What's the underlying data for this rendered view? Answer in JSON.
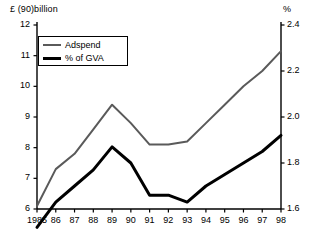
{
  "chart_data": {
    "type": "line",
    "title": "",
    "xlabel": "",
    "ylabel": "£ (90)billion",
    "y2label": "%",
    "grid": false,
    "legend_position": "top-left",
    "categories": [
      "1985",
      "86",
      "87",
      "88",
      "89",
      "90",
      "91",
      "92",
      "93",
      "94",
      "95",
      "96",
      "97",
      "98"
    ],
    "x": [
      1985,
      1986,
      1987,
      1988,
      1989,
      1990,
      1991,
      1992,
      1993,
      1994,
      1995,
      1996,
      1997,
      1998
    ],
    "ylim": [
      6,
      12
    ],
    "yticks": [
      6,
      7,
      8,
      9,
      10,
      11,
      12
    ],
    "ytick_labels": [
      "6",
      "7",
      "8",
      "9",
      "10",
      "11",
      "12"
    ],
    "y2lim": [
      1.6,
      2.4
    ],
    "y2ticks": [
      1.6,
      1.8,
      2.0,
      2.2,
      2.4
    ],
    "y2tick_labels": [
      "1.6",
      "1.8",
      "2.0",
      "2.2",
      "2.4"
    ],
    "series": [
      {
        "name": "Adspend",
        "axis": "left",
        "color": "#5a5a5a",
        "width": 2,
        "values": [
          6.1,
          7.3,
          7.8,
          8.6,
          9.4,
          8.8,
          8.1,
          8.1,
          8.2,
          8.8,
          9.4,
          10.0,
          10.5,
          11.15
        ]
      },
      {
        "name": "% of GVA",
        "axis": "right",
        "color": "#000000",
        "width": 3,
        "values": [
          1.52,
          1.63,
          1.7,
          1.77,
          1.87,
          1.8,
          1.66,
          1.66,
          1.63,
          1.7,
          1.75,
          1.8,
          1.85,
          1.92
        ]
      }
    ]
  },
  "titles": {
    "left": "£ (90)billion",
    "right": "%"
  },
  "legend": {
    "items": [
      {
        "label": "Adspend",
        "swatch": "line-swatch-gray"
      },
      {
        "label": "% of GVA",
        "swatch": "line-swatch-black"
      }
    ]
  }
}
